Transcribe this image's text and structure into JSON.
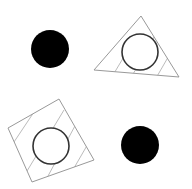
{
  "canvas": {
    "width": 192,
    "height": 189,
    "background": "#ffffff"
  },
  "colors": {
    "fill": "#000000",
    "outline": "#333333",
    "hatch": "#999999"
  },
  "shapes": {
    "filled_circle_top_left": {
      "cx": 50,
      "cy": 49,
      "r": 19
    },
    "triangle": {
      "points": "141,16 94,70 179,77",
      "circle": {
        "cx": 140,
        "cy": 52,
        "r": 18
      }
    },
    "quadrilateral": {
      "points": "59,99 8,128 32,182 94,160",
      "circle": {
        "cx": 51,
        "cy": 146,
        "r": 18
      }
    },
    "filled_circle_bottom_right": {
      "cx": 140,
      "cy": 145,
      "r": 19
    }
  }
}
